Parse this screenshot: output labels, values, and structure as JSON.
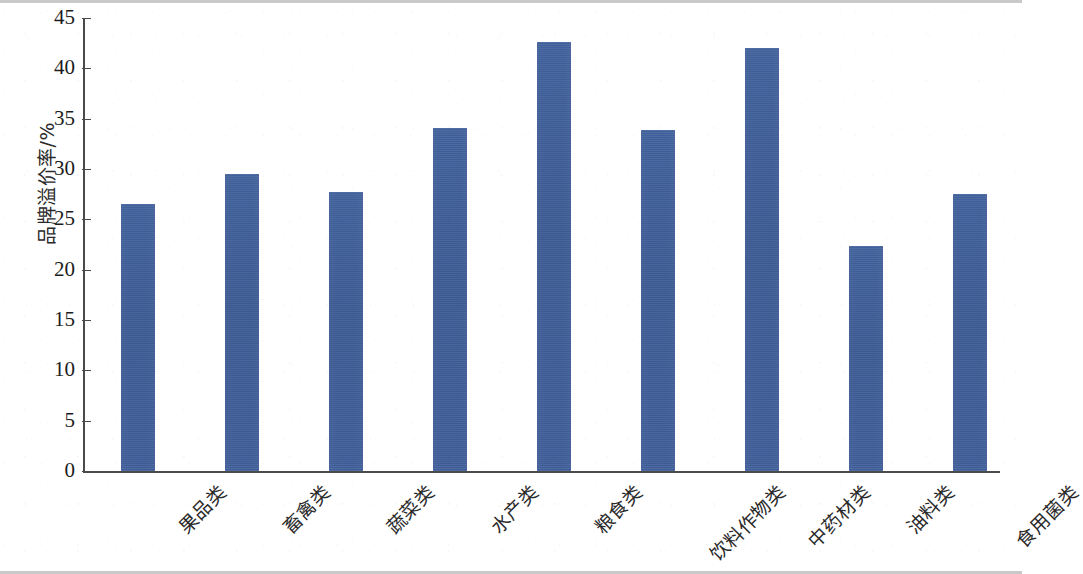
{
  "chart_data": {
    "type": "bar",
    "title": "",
    "subtitle": "",
    "xlabel": "",
    "ylabel": "品牌溢价率/%",
    "categories": [
      "果品类",
      "畜禽类",
      "蔬菜类",
      "水产类",
      "粮食类",
      "饮料作物类",
      "中药材类",
      "油料类",
      "食用菌类"
    ],
    "values": [
      26.5,
      29.5,
      27.7,
      34.1,
      42.6,
      33.9,
      42.0,
      22.4,
      27.5
    ],
    "series": [
      {
        "name": "品牌溢价率",
        "values": [
          26.5,
          29.5,
          27.7,
          34.1,
          42.6,
          33.9,
          42.0,
          22.4,
          27.5
        ]
      }
    ],
    "ylim": [
      0,
      45
    ],
    "yticks": [
      0,
      5,
      10,
      15,
      20,
      25,
      30,
      35,
      40,
      45
    ],
    "ytick_labels": [
      "0",
      "5",
      "10",
      "15",
      "20",
      "25",
      "30",
      "35",
      "40",
      "45"
    ],
    "grid": false,
    "legend": null,
    "legend_position": "none",
    "bar_color": "#3f5f9b",
    "axis_color": "#4a4a4a",
    "background_color": "#ffffff",
    "xtick_label_rotation": -45
  }
}
